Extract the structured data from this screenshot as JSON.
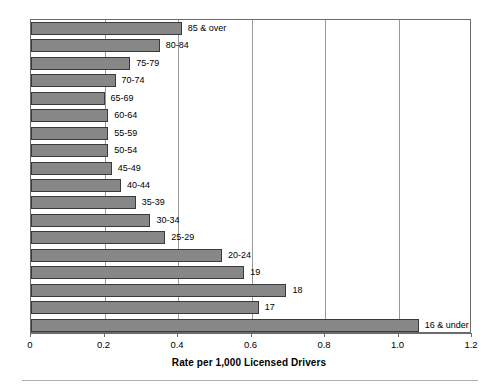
{
  "chart_data": {
    "type": "bar",
    "orientation": "horizontal",
    "title": "",
    "xlabel": "Rate per 1,000 Licensed Drivers",
    "ylabel": "",
    "xlim": [
      0,
      1.2
    ],
    "xticks": [
      "0",
      "0.2",
      "0.4",
      "0.6",
      "0.8",
      "1.0",
      "1.2"
    ],
    "xtick_values": [
      0,
      0.2,
      0.4,
      0.6,
      0.8,
      1.0,
      1.2
    ],
    "grid": "vertical",
    "legend": "none",
    "bar_color": "#878787",
    "bar_edge_color": "#3a3a3a",
    "categories": [
      "85 & over",
      "80-84",
      "75-79",
      "70-74",
      "65-69",
      "60-64",
      "55-59",
      "50-54",
      "45-49",
      "40-44",
      "35-39",
      "30-34",
      "25-29",
      "20-24",
      "19",
      "18",
      "17",
      "16 & under"
    ],
    "values": [
      0.41,
      0.35,
      0.27,
      0.23,
      0.2,
      0.21,
      0.21,
      0.21,
      0.22,
      0.245,
      0.285,
      0.325,
      0.365,
      0.52,
      0.58,
      0.695,
      0.62,
      1.055
    ]
  }
}
